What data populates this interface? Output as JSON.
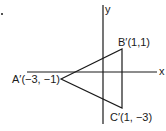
{
  "diagram": {
    "type": "coordinate-plane-triangle",
    "axes": {
      "x_label": "x",
      "y_label": "y"
    },
    "vertices": [
      {
        "name": "A'",
        "label": "A′(−3, −1)",
        "coords": [
          -3,
          -1
        ]
      },
      {
        "name": "B'",
        "label": "B′(1,1)",
        "coords": [
          1,
          1
        ]
      },
      {
        "name": "C'",
        "label": "C′(1, −3)",
        "coords": [
          1,
          -3
        ]
      }
    ],
    "stroke_color": "#1a1a1a"
  }
}
